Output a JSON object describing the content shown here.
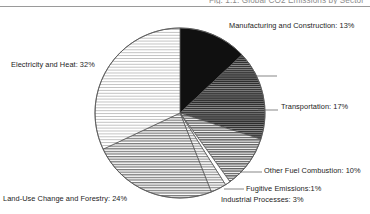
{
  "figure": {
    "title": "Fig. 1.1: Global CO2 Emissions by Sector",
    "rule_color": "#9a9a9a"
  },
  "chart_data": {
    "type": "pie",
    "title": "Fig. 1.1: Global CO2 Emissions by Sector",
    "xlabel": "",
    "ylabel": "",
    "units": "percent",
    "start_angle_deg": 0,
    "direction": "clockwise",
    "legend": "none",
    "labels_position": "outside-with-leader-lines",
    "categories": [
      "Manufacturing and Construction",
      "Transportation",
      "Other Fuel Combustion",
      "Fugitive Emissions",
      "Industrial Processes",
      "Land-Use Change and Forestry",
      "Electricity and Heat"
    ],
    "values": [
      13,
      17,
      10,
      1,
      3,
      24,
      32
    ],
    "slices": [
      {
        "name": "Manufacturing and Construction",
        "value": 13,
        "label": "Manufacturing and Construction: 13%",
        "fill": "solid-black",
        "color": "#101010"
      },
      {
        "name": "Transportation",
        "value": 17,
        "label": "Transportation: 17%",
        "fill": "dense-horizontal-hatch",
        "color": "#4a4a4a"
      },
      {
        "name": "Other Fuel Combustion",
        "value": 10,
        "label": "Other Fuel Combustion: 10%",
        "fill": "medium-horizontal-hatch",
        "color": "#6f6f6f"
      },
      {
        "name": "Fugitive Emissions",
        "value": 1,
        "label": "Fugitive Emissions: 1%",
        "fill": "white",
        "color": "#ffffff"
      },
      {
        "name": "Industrial Processes",
        "value": 3,
        "label": "Industrial Processes: 3%",
        "fill": "light-horizontal-hatch",
        "color": "#909090"
      },
      {
        "name": "Land-Use Change and Forestry",
        "value": 24,
        "label": "Land-Use Change and Forestry: 24%",
        "fill": "mid-horizontal-hatch",
        "color": "#8a8a8a"
      },
      {
        "name": "Electricity and Heat",
        "value": 32,
        "label": "Electricity and Heat: 32%",
        "fill": "sparse-horizontal-hatch",
        "color": "#cfcfcf"
      }
    ],
    "total": 100
  },
  "labels": {
    "manufacturing": "Manufacturing and Construction: 13%",
    "transportation": "Transportation: 17%",
    "other_fuel": "Other Fuel Combustion: 10%",
    "fugitive": "Fugitive Emissions:1%",
    "industrial": "Industrial Processes: 3%",
    "electricity": "Electricity and Heat: 32%",
    "landuse": "Land-Use Change and Forestry: 24%"
  }
}
